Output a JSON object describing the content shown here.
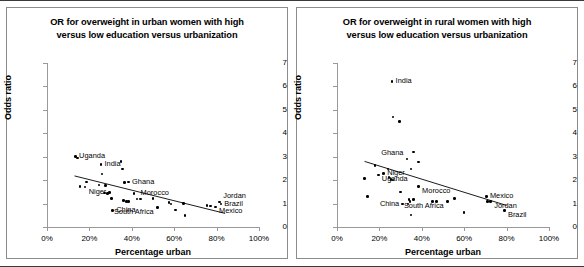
{
  "figure": {
    "axis_titles": {
      "x": "Percentage urban",
      "y": "Odds ratio"
    },
    "xticks": [
      "0%",
      "20%",
      "40%",
      "60%",
      "80%",
      "100%"
    ],
    "yticks": [
      "0",
      "1",
      "2",
      "3",
      "4",
      "5",
      "6",
      "7"
    ]
  },
  "chart_data": [
    {
      "type": "scatter",
      "id": "urban",
      "title": "OR for overweight in urban women with high versus low education versus urbanization",
      "title_line1": "OR for overweight in urban women with high",
      "title_line2": "versus low education versus urbanization",
      "xlabel": "Percentage urban",
      "ylabel": "Odds ratio",
      "xlim": [
        0,
        100
      ],
      "ylim": [
        0,
        7
      ],
      "xticks": [
        0,
        20,
        40,
        60,
        80,
        100
      ],
      "yticks": [
        0,
        1,
        2,
        3,
        4,
        5,
        6,
        7
      ],
      "grid": false,
      "legend": "none",
      "trendline": {
        "x0": 13,
        "y0": 2.18,
        "x1": 84,
        "y1": 0.58
      },
      "points": [
        {
          "x": 13.5,
          "y": 3.02,
          "label": "Uganda",
          "label_pos": "right"
        },
        {
          "x": 14.5,
          "y": 2.95,
          "label": ""
        },
        {
          "x": 18.5,
          "y": 1.92,
          "label": ""
        },
        {
          "x": 15.5,
          "y": 1.72,
          "label": ""
        },
        {
          "x": 18.0,
          "y": 1.7,
          "label": "Niger",
          "label_pos": "right-below"
        },
        {
          "x": 25.5,
          "y": 2.68,
          "label": "India",
          "label_pos": "right"
        },
        {
          "x": 26.0,
          "y": 2.27,
          "label": ""
        },
        {
          "x": 24.5,
          "y": 1.8,
          "label": ""
        },
        {
          "x": 27.5,
          "y": 1.78,
          "label": ""
        },
        {
          "x": 27.0,
          "y": 1.45,
          "label": ""
        },
        {
          "x": 28.5,
          "y": 1.42,
          "label": ""
        },
        {
          "x": 29.5,
          "y": 1.48,
          "label": ""
        },
        {
          "x": 30.5,
          "y": 1.22,
          "label": ""
        },
        {
          "x": 31.0,
          "y": 0.7,
          "label": "China",
          "label_pos": "right"
        },
        {
          "x": 35.0,
          "y": 2.8,
          "label": ""
        },
        {
          "x": 35.5,
          "y": 2.47,
          "label": ""
        },
        {
          "x": 36.5,
          "y": 1.9,
          "label": ""
        },
        {
          "x": 38.5,
          "y": 1.92,
          "label": "Ghana",
          "label_pos": "right"
        },
        {
          "x": 36.0,
          "y": 1.12,
          "label": ""
        },
        {
          "x": 37.5,
          "y": 1.08,
          "label": ""
        },
        {
          "x": 38.5,
          "y": 1.1,
          "label": ""
        },
        {
          "x": 41.0,
          "y": 1.42,
          "label": ""
        },
        {
          "x": 42.5,
          "y": 1.2,
          "label": "Morocco",
          "label_pos": "right-above"
        },
        {
          "x": 44.0,
          "y": 1.2,
          "label": ""
        },
        {
          "x": 50.0,
          "y": 1.22,
          "label": ""
        },
        {
          "x": 52.0,
          "y": 0.82,
          "label": "South Africa",
          "label_pos": "left-below"
        },
        {
          "x": 57.5,
          "y": 1.05,
          "label": ""
        },
        {
          "x": 58.5,
          "y": 0.98,
          "label": ""
        },
        {
          "x": 60.5,
          "y": 0.72,
          "label": ""
        },
        {
          "x": 64.5,
          "y": 1.0,
          "label": ""
        },
        {
          "x": 65.0,
          "y": 0.48,
          "label": ""
        },
        {
          "x": 75.5,
          "y": 0.92,
          "label": ""
        },
        {
          "x": 77.0,
          "y": 0.9,
          "label": ""
        },
        {
          "x": 79.5,
          "y": 0.86,
          "label": "Mexico",
          "label_pos": "right-below"
        },
        {
          "x": 81.5,
          "y": 1.06,
          "label": "Jordan",
          "label_pos": "right-above"
        },
        {
          "x": 82.0,
          "y": 0.98,
          "label": "Brazil",
          "label_pos": "right"
        }
      ]
    },
    {
      "type": "scatter",
      "id": "rural",
      "title": "OR for overweight in rural women with high versus low education versus urbanization",
      "title_line1": "OR for overweight in rural women with high",
      "title_line2": "versus low education versus urbanization",
      "xlabel": "Percentage urban",
      "ylabel": "Odds ratio",
      "xlim": [
        0,
        100
      ],
      "ylim": [
        0,
        7
      ],
      "xticks": [
        0,
        20,
        40,
        60,
        80,
        100
      ],
      "yticks": [
        0,
        1,
        2,
        3,
        4,
        5,
        6,
        7
      ],
      "grid": false,
      "legend": "none",
      "trendline": {
        "x0": 13,
        "y0": 2.8,
        "x1": 80,
        "y1": 0.92
      },
      "points": [
        {
          "x": 26.0,
          "y": 6.2,
          "label": "India",
          "label_pos": "right"
        },
        {
          "x": 26.5,
          "y": 4.7,
          "label": ""
        },
        {
          "x": 29.5,
          "y": 4.5,
          "label": ""
        },
        {
          "x": 13.0,
          "y": 2.08,
          "label": ""
        },
        {
          "x": 14.5,
          "y": 1.3,
          "label": ""
        },
        {
          "x": 18.0,
          "y": 2.62,
          "label": ""
        },
        {
          "x": 19.5,
          "y": 2.22,
          "label": "Uganda",
          "label_pos": "right-below"
        },
        {
          "x": 22.0,
          "y": 2.28,
          "label": "Niger",
          "label_pos": "right"
        },
        {
          "x": 24.0,
          "y": 2.48,
          "label": ""
        },
        {
          "x": 24.5,
          "y": 2.12,
          "label": ""
        },
        {
          "x": 25.5,
          "y": 2.02,
          "label": ""
        },
        {
          "x": 26.5,
          "y": 2.0,
          "label": ""
        },
        {
          "x": 30.0,
          "y": 1.5,
          "label": ""
        },
        {
          "x": 33.0,
          "y": 2.9,
          "label": "Ghana",
          "label_pos": "left-above"
        },
        {
          "x": 36.0,
          "y": 3.2,
          "label": ""
        },
        {
          "x": 35.0,
          "y": 2.48,
          "label": ""
        },
        {
          "x": 38.5,
          "y": 2.78,
          "label": ""
        },
        {
          "x": 34.0,
          "y": 1.18,
          "label": ""
        },
        {
          "x": 34.5,
          "y": 1.08,
          "label": ""
        },
        {
          "x": 36.0,
          "y": 1.18,
          "label": ""
        },
        {
          "x": 35.0,
          "y": 0.52,
          "label": ""
        },
        {
          "x": 31.0,
          "y": 0.98,
          "label": "China",
          "label_pos": "left"
        },
        {
          "x": 33.5,
          "y": 0.98,
          "label": ""
        },
        {
          "x": 38.5,
          "y": 1.72,
          "label": "Morocco",
          "label_pos": "right-below"
        },
        {
          "x": 45.0,
          "y": 1.08,
          "label": ""
        },
        {
          "x": 47.0,
          "y": 1.08,
          "label": ""
        },
        {
          "x": 52.0,
          "y": 1.08,
          "label": "South Africa",
          "label_pos": "left-below"
        },
        {
          "x": 55.5,
          "y": 1.22,
          "label": ""
        },
        {
          "x": 60.0,
          "y": 0.62,
          "label": ""
        },
        {
          "x": 70.5,
          "y": 1.3,
          "label": "Mexico",
          "label_pos": "right"
        },
        {
          "x": 71.0,
          "y": 1.1,
          "label": ""
        },
        {
          "x": 72.5,
          "y": 1.1,
          "label": "Jordan",
          "label_pos": "right-below"
        },
        {
          "x": 79.0,
          "y": 0.7,
          "label": "Brazil",
          "label_pos": "right-below"
        }
      ]
    }
  ]
}
